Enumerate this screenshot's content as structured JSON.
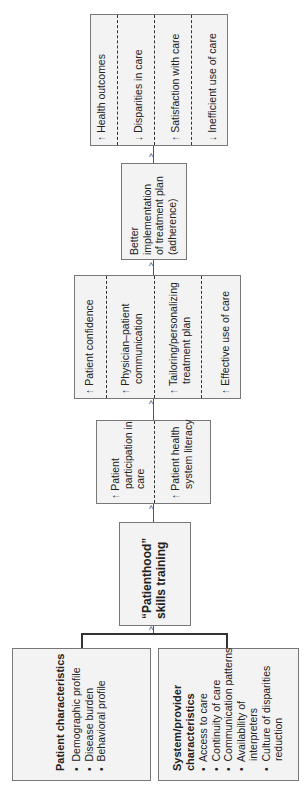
{
  "outcomes": {
    "items": [
      {
        "arrow": "↑",
        "label": "Health outcomes"
      },
      {
        "arrow": "↓",
        "label": "Disparities in care"
      },
      {
        "arrow": "↑",
        "label": "Satisfaction with care"
      },
      {
        "arrow": "↓",
        "label": "Inefficient use of care"
      }
    ]
  },
  "adherence": {
    "lines": [
      "Better",
      "implementation",
      "of treatment plan",
      "(adherence)"
    ]
  },
  "intermediate": {
    "items": [
      {
        "arrow": "↑",
        "lines": [
          "Patient confidence"
        ]
      },
      {
        "arrow": "↑",
        "lines": [
          "Physician–patient",
          "communication"
        ]
      },
      {
        "arrow": "↑",
        "lines": [
          "Tailoring/personalizing",
          "treatment plan"
        ]
      },
      {
        "arrow": "↑",
        "lines": [
          "Effective use of care"
        ]
      }
    ]
  },
  "participation": {
    "items": [
      {
        "arrow": "↑",
        "lines": [
          "Patient",
          "participation in",
          "care"
        ]
      },
      {
        "arrow": "↑",
        "lines": [
          "Patient health",
          "system literacy"
        ]
      }
    ]
  },
  "training": {
    "lines": [
      "“Patienthood”",
      "skills training"
    ]
  },
  "patient_characteristics": {
    "title": "Patient characteristics",
    "bullets": [
      "Demographic profile",
      "Disease burden",
      "Behavioral profile"
    ]
  },
  "system_characteristics": {
    "title_lines": [
      "System/provider",
      "characteristics"
    ],
    "bullets": [
      [
        "Access to care"
      ],
      [
        "Continuity of care"
      ],
      [
        "Communication patterns"
      ],
      [
        "Availability of",
        "interpreters"
      ],
      [
        "Culture of disparities",
        "reduction"
      ]
    ],
    "bullet_char": "•"
  },
  "colors": {
    "box_fill": "#f3f3f3",
    "border": "#777777",
    "text": "#222222"
  }
}
